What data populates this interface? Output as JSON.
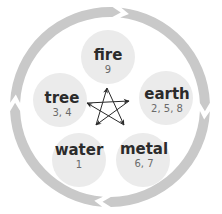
{
  "diagram": {
    "colors": {
      "ring": "#c9c9c9",
      "node_fill": "#ebebeb",
      "star_stroke": "#2a2a2a"
    },
    "cycle_direction": "clockwise",
    "elements": [
      {
        "id": "fire",
        "label": "fire",
        "numbers": "9"
      },
      {
        "id": "earth",
        "label": "earth",
        "numbers": "2, 5, 8"
      },
      {
        "id": "metal",
        "label": "metal",
        "numbers": "6, 7"
      },
      {
        "id": "water",
        "label": "water",
        "numbers": "1"
      },
      {
        "id": "tree",
        "label": "tree",
        "numbers": "3, 4"
      }
    ],
    "generating_cycle": [
      "fire",
      "earth",
      "metal",
      "water",
      "tree"
    ],
    "controlling_star": [
      "fire",
      "metal",
      "tree",
      "earth",
      "water"
    ]
  }
}
